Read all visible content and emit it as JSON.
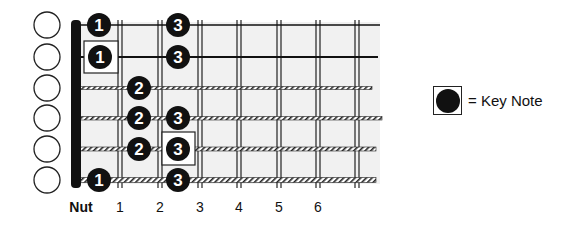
{
  "diagram": {
    "type": "guitar-fretboard-scale",
    "nut_label": "Nut",
    "fret_labels": [
      "1",
      "2",
      "3",
      "4",
      "5",
      "6"
    ],
    "strings": 6,
    "open_string_markers": [
      "",
      "",
      "",
      "",
      "",
      ""
    ],
    "notes": [
      {
        "string": 1,
        "fret": 1,
        "finger": "1",
        "key_note": false
      },
      {
        "string": 1,
        "fret": 3,
        "finger": "3",
        "key_note": false
      },
      {
        "string": 2,
        "fret": 1,
        "finger": "1",
        "key_note": true
      },
      {
        "string": 2,
        "fret": 3,
        "finger": "3",
        "key_note": false
      },
      {
        "string": 3,
        "fret": 2,
        "finger": "2",
        "key_note": false
      },
      {
        "string": 4,
        "fret": 2,
        "finger": "2",
        "key_note": false
      },
      {
        "string": 4,
        "fret": 3,
        "finger": "3",
        "key_note": false
      },
      {
        "string": 5,
        "fret": 2,
        "finger": "2",
        "key_note": false
      },
      {
        "string": 5,
        "fret": 3,
        "finger": "3",
        "key_note": true
      },
      {
        "string": 6,
        "fret": 1,
        "finger": "1",
        "key_note": false
      },
      {
        "string": 6,
        "fret": 3,
        "finger": "3",
        "key_note": false
      }
    ]
  },
  "legend": {
    "label": "= Key Note"
  },
  "colors": {
    "ink": "#111111",
    "fretboard": "#f2f2f2",
    "background": "#ffffff"
  }
}
